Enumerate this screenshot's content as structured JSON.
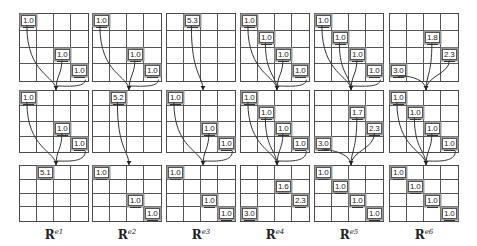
{
  "figure": {
    "columns": [
      {
        "label_base": "R",
        "label_sup": "e1",
        "grids": [
          {
            "cells": [
              {
                "r": 0,
                "c": 0,
                "v": "1.0"
              },
              {
                "r": 2,
                "c": 2,
                "v": "1.0"
              },
              {
                "r": 3,
                "c": 3,
                "v": "1.0"
              }
            ]
          },
          {
            "cells": [
              {
                "r": 0,
                "c": 0,
                "v": "1.0"
              },
              {
                "r": 2,
                "c": 2,
                "v": "1.0"
              },
              {
                "r": 3,
                "c": 3,
                "v": "1.0"
              }
            ]
          },
          {
            "cells": [
              {
                "r": 0,
                "c": 1,
                "v": "5.1"
              }
            ]
          }
        ]
      },
      {
        "label_base": "R",
        "label_sup": "e2",
        "grids": [
          {
            "cells": [
              {
                "r": 0,
                "c": 0,
                "v": "1.0"
              },
              {
                "r": 2,
                "c": 2,
                "v": "1.0"
              },
              {
                "r": 3,
                "c": 3,
                "v": "1.0"
              }
            ]
          },
          {
            "cells": [
              {
                "r": 0,
                "c": 1,
                "v": "5.2"
              }
            ]
          },
          {
            "cells": [
              {
                "r": 0,
                "c": 0,
                "v": "1.0"
              },
              {
                "r": 2,
                "c": 2,
                "v": "1.0"
              },
              {
                "r": 3,
                "c": 3,
                "v": "1.0"
              }
            ]
          }
        ]
      },
      {
        "label_base": "R",
        "label_sup": "e3",
        "grids": [
          {
            "cells": [
              {
                "r": 0,
                "c": 1,
                "v": "5.3"
              }
            ]
          },
          {
            "cells": [
              {
                "r": 0,
                "c": 0,
                "v": "1.0"
              },
              {
                "r": 2,
                "c": 2,
                "v": "1.0"
              },
              {
                "r": 3,
                "c": 3,
                "v": "1.0"
              }
            ]
          },
          {
            "cells": [
              {
                "r": 0,
                "c": 0,
                "v": "1.0"
              },
              {
                "r": 2,
                "c": 2,
                "v": "1.0"
              },
              {
                "r": 3,
                "c": 3,
                "v": "1.0"
              }
            ]
          }
        ]
      },
      {
        "label_base": "R",
        "label_sup": "e4",
        "grids": [
          {
            "cells": [
              {
                "r": 0,
                "c": 0,
                "v": "1.0"
              },
              {
                "r": 1,
                "c": 1,
                "v": "1.0"
              },
              {
                "r": 2,
                "c": 2,
                "v": "1.0"
              },
              {
                "r": 3,
                "c": 3,
                "v": "1.0"
              }
            ]
          },
          {
            "cells": [
              {
                "r": 0,
                "c": 0,
                "v": "1.0"
              },
              {
                "r": 1,
                "c": 1,
                "v": "1.0"
              },
              {
                "r": 2,
                "c": 2,
                "v": "1.0"
              },
              {
                "r": 3,
                "c": 3,
                "v": "1.0"
              }
            ]
          },
          {
            "cells": [
              {
                "r": 1,
                "c": 2,
                "v": "1.6"
              },
              {
                "r": 2,
                "c": 3,
                "v": "2.3"
              },
              {
                "r": 3,
                "c": 0,
                "v": "3.0"
              }
            ]
          }
        ]
      },
      {
        "label_base": "R",
        "label_sup": "e5",
        "grids": [
          {
            "cells": [
              {
                "r": 0,
                "c": 0,
                "v": "1.0"
              },
              {
                "r": 1,
                "c": 1,
                "v": "1.0"
              },
              {
                "r": 2,
                "c": 2,
                "v": "1.0"
              },
              {
                "r": 3,
                "c": 3,
                "v": "1.0"
              }
            ]
          },
          {
            "cells": [
              {
                "r": 1,
                "c": 2,
                "v": "1.7"
              },
              {
                "r": 2,
                "c": 3,
                "v": "2.3"
              },
              {
                "r": 3,
                "c": 0,
                "v": "3.0"
              }
            ]
          },
          {
            "cells": [
              {
                "r": 0,
                "c": 0,
                "v": "1.0"
              },
              {
                "r": 1,
                "c": 1,
                "v": "1.0"
              },
              {
                "r": 2,
                "c": 2,
                "v": "1.0"
              },
              {
                "r": 3,
                "c": 3,
                "v": "1.0"
              }
            ]
          }
        ]
      },
      {
        "label_base": "R",
        "label_sup": "e6",
        "grids": [
          {
            "cells": [
              {
                "r": 1,
                "c": 2,
                "v": "1.8"
              },
              {
                "r": 2,
                "c": 3,
                "v": "2.3"
              },
              {
                "r": 3,
                "c": 0,
                "v": "3.0"
              }
            ]
          },
          {
            "cells": [
              {
                "r": 0,
                "c": 0,
                "v": "1.0"
              },
              {
                "r": 1,
                "c": 1,
                "v": "1.0"
              },
              {
                "r": 2,
                "c": 2,
                "v": "1.0"
              },
              {
                "r": 3,
                "c": 3,
                "v": "1.0"
              }
            ]
          },
          {
            "cells": [
              {
                "r": 0,
                "c": 0,
                "v": "1.0"
              },
              {
                "r": 1,
                "c": 1,
                "v": "1.0"
              },
              {
                "r": 2,
                "c": 2,
                "v": "1.0"
              },
              {
                "r": 3,
                "c": 3,
                "v": "1.0"
              }
            ]
          }
        ]
      }
    ]
  }
}
